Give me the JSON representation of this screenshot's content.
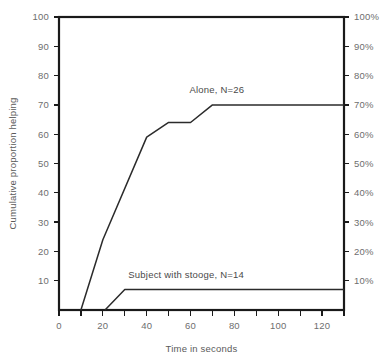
{
  "figure": {
    "background_color": "#ffffff",
    "frame_color": "#1a1a1a",
    "label_color": "#6e6e6e",
    "line_color": "#2b2b2b"
  },
  "chart_data": {
    "type": "line",
    "title": "",
    "subtitle": "",
    "xlabel": "Time in seconds",
    "ylabel": "Cumulative proportion helping",
    "ylabel_right": "",
    "xlim": [
      0,
      130
    ],
    "ylim": [
      0,
      100
    ],
    "grid": false,
    "legend_position": "inline-annotation",
    "x_ticks_major": [
      0,
      20,
      40,
      60,
      80,
      100,
      120
    ],
    "x_tick_labels": [
      "0",
      "20",
      "40",
      "60",
      "80",
      "100",
      "120"
    ],
    "x_ticks_minor": [
      10,
      30,
      50,
      70,
      90,
      110,
      130
    ],
    "y_ticks_left": [
      10,
      20,
      30,
      40,
      50,
      60,
      70,
      80,
      90,
      100
    ],
    "y_tick_labels_left": [
      "10",
      "20",
      "30",
      "40",
      "50",
      "60",
      "70",
      "80",
      "90",
      "100"
    ],
    "y_ticks_right": [
      10,
      20,
      30,
      40,
      50,
      60,
      70,
      80,
      90,
      100
    ],
    "y_tick_labels_right": [
      "10%",
      "20%",
      "30%",
      "40%",
      "50%",
      "60%",
      "70%",
      "80%",
      "90%",
      "100%"
    ],
    "series": [
      {
        "name": "Alone, N=26",
        "label": "Alone, N=26",
        "label_x": 72,
        "label_y": 74,
        "x": [
          10,
          20,
          40,
          50,
          60,
          70,
          130
        ],
        "values": [
          0,
          24,
          59,
          64,
          64,
          70,
          70
        ]
      },
      {
        "name": "Subject with stooge, N=14",
        "label": "Subject with stooge, N=14",
        "label_x": 58,
        "label_y": 11,
        "x": [
          21,
          30,
          130
        ],
        "values": [
          0,
          7,
          7
        ]
      }
    ]
  }
}
